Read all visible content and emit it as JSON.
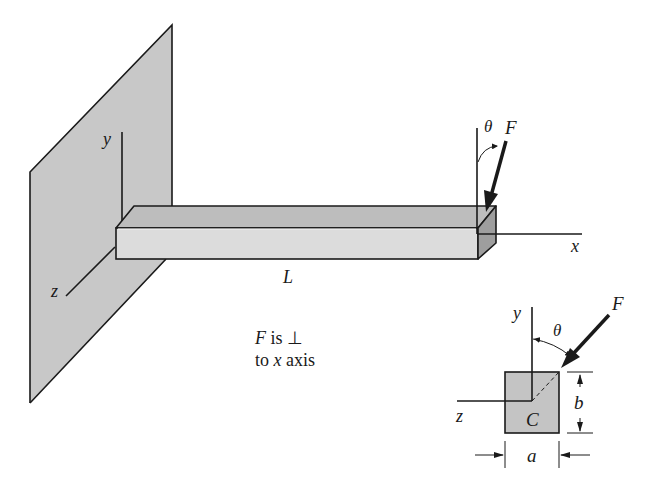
{
  "figure": {
    "type": "engineering-diagram"
  },
  "main_view": {
    "axis_labels": {
      "y": "y",
      "z": "z",
      "x": "x"
    },
    "length_label": "L",
    "angle_label": "θ",
    "force_label": "F",
    "note_line1_var": "F",
    "note_line1_text": " is ⊥",
    "note_line2_pre": "to ",
    "note_line2_var": "x",
    "note_line2_post": " axis"
  },
  "cross_section": {
    "axis_labels": {
      "y": "y",
      "z": "z"
    },
    "angle_label": "θ",
    "force_label": "F",
    "centroid_label": "C",
    "width_label": "a",
    "height_label": "b"
  },
  "colors": {
    "wall_fill": "#c8c8c8",
    "beam_front": "#dcdcdc",
    "beam_top": "#bdbdbd",
    "beam_end": "#9e9e9e",
    "section_fill": "#c4c4c4",
    "line": "#1a1a1a"
  }
}
